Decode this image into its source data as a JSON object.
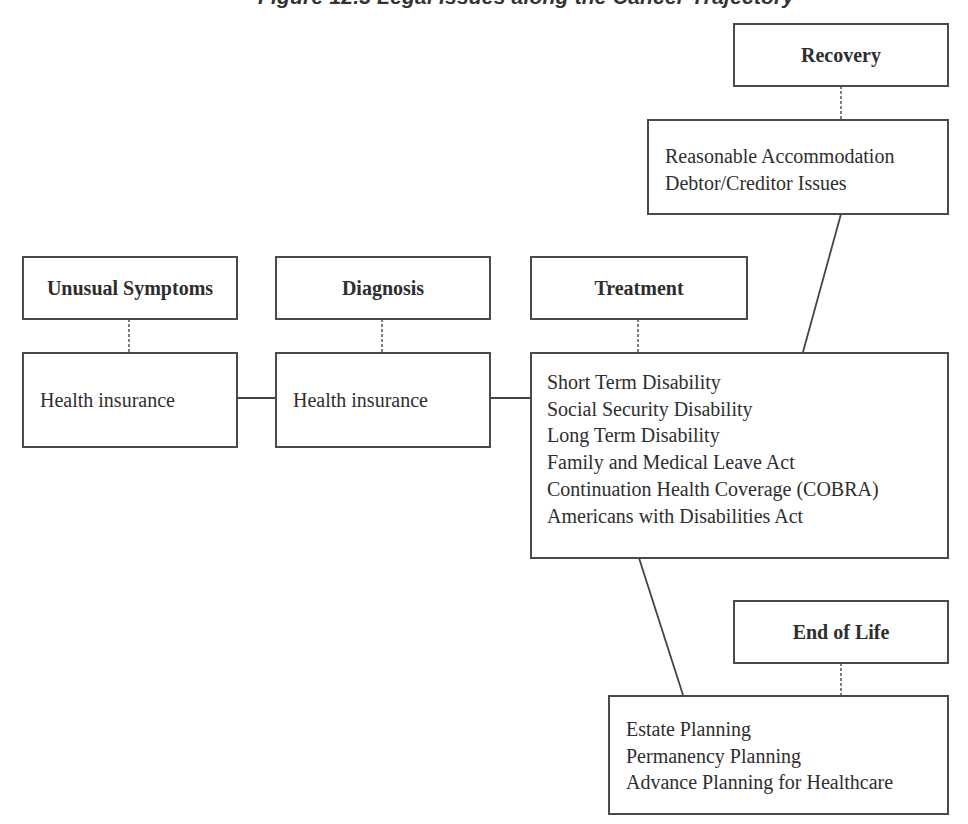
{
  "figure": {
    "title": "Figure 12.3  Legal Issues along the Cancer Trajectory"
  },
  "stages": {
    "unusual_symptoms": {
      "label": "Unusual Symptoms",
      "issues": [
        "Health insurance"
      ]
    },
    "diagnosis": {
      "label": "Diagnosis",
      "issues": [
        "Health insurance"
      ]
    },
    "treatment": {
      "label": "Treatment",
      "issues": [
        "Short Term Disability",
        "Social Security Disability",
        "Long Term Disability",
        "Family and Medical Leave Act",
        "Continuation Health Coverage (COBRA)",
        "Americans with Disabilities Act"
      ]
    },
    "recovery": {
      "label": "Recovery",
      "issues": [
        "Reasonable Accommodation",
        "Debtor/Creditor Issues"
      ]
    },
    "end_of_life": {
      "label": "End of Life",
      "issues": [
        "Estate Planning",
        "Permanency Planning",
        "Advance Planning for Healthcare"
      ]
    }
  },
  "colors": {
    "border": "#4a4a4a",
    "text": "#2e2e2e",
    "background": "#ffffff"
  }
}
